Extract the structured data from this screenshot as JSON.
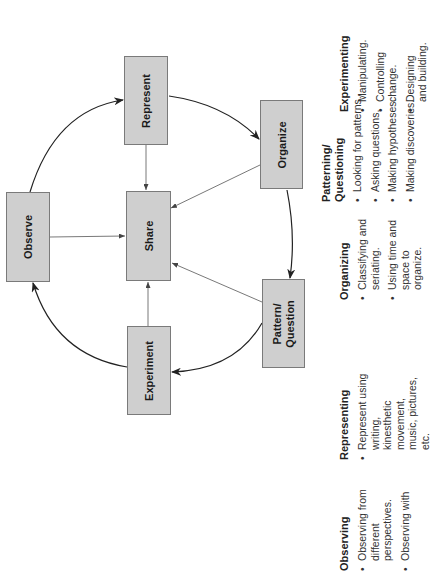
{
  "diagram": {
    "orientation": "rotated -90 degrees",
    "colors": {
      "box_fill": "#cfcfcf",
      "box_border": "#7a7a7a",
      "arrow": "#222222",
      "connector": "#555555"
    },
    "nodes": [
      {
        "id": "observe",
        "label": "Observe"
      },
      {
        "id": "represent",
        "label": "Represent"
      },
      {
        "id": "organize",
        "label": "Organize"
      },
      {
        "id": "pattern",
        "label": "Pattern/ Question"
      },
      {
        "id": "experiment",
        "label": "Experiment"
      },
      {
        "id": "share",
        "label": "Share"
      }
    ],
    "cycle_edges": [
      [
        "Observe",
        "Represent"
      ],
      [
        "Represent",
        "Organize"
      ],
      [
        "Organize",
        "Pattern/ Question"
      ],
      [
        "Pattern/ Question",
        "Experiment"
      ],
      [
        "Experiment",
        "Observe"
      ]
    ],
    "share_edges": [
      [
        "Observe",
        "Share"
      ],
      [
        "Represent",
        "Share"
      ],
      [
        "Organize",
        "Share"
      ],
      [
        "Pattern/ Question",
        "Share"
      ],
      [
        "Experiment",
        "Share"
      ]
    ]
  },
  "columns": [
    {
      "heading": "Experimenting",
      "bullets": [
        "Manipulating.",
        "Controlling change.",
        "Designing and building."
      ]
    },
    {
      "heading": "Patterning/ Questioning",
      "bullets": [
        "Looking for patterns.",
        "Asking questions.",
        "Making hypotheses.",
        "Making discoveries."
      ]
    },
    {
      "heading": "Organizing",
      "bullets": [
        "Classifying and seriating.",
        "Using time and space to organize."
      ]
    },
    {
      "heading": "Representing",
      "bullets": [
        "Represent using writing, kinesthetic movement, music, pictures, etc."
      ]
    },
    {
      "heading": "Observing",
      "bullets": [
        "Observing from different perspectives.",
        "Observing with"
      ]
    }
  ]
}
